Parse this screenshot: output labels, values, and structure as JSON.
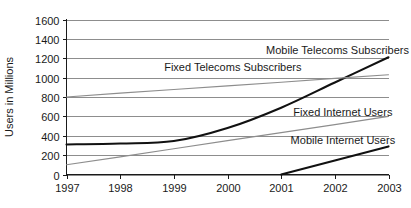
{
  "chart_data": {
    "type": "line",
    "title": "",
    "xlabel": "",
    "ylabel": "Users in Millions",
    "x": [
      1997,
      1998,
      1999,
      2000,
      2001,
      2002,
      2003
    ],
    "xticklabels": [
      "1997",
      "1998",
      "1999",
      "2000",
      "2001",
      "2002",
      "2003"
    ],
    "yticks": [
      0,
      200,
      400,
      600,
      800,
      1000,
      1200,
      1400,
      1600
    ],
    "yticklabels": [
      "0",
      "200",
      "400",
      "600",
      "800",
      "1000",
      "1200",
      "1400",
      "1600"
    ],
    "xlim": [
      1997,
      2003
    ],
    "ylim": [
      0,
      1600
    ],
    "grid": "horizontal",
    "legend_position": "inline-labels",
    "series": [
      {
        "name": "Mobile Telecoms Subscribers",
        "style": "bold",
        "color": "#111111",
        "x": [
          1997,
          1998,
          1999,
          2000,
          2001,
          2002,
          2003
        ],
        "values": [
          310,
          320,
          345,
          480,
          690,
          950,
          1210
        ],
        "label_x": 2002.05,
        "label_y": 1290,
        "label_anchor": "middle"
      },
      {
        "name": "Fixed Telecoms Subscribers",
        "style": "thin",
        "color": "#8d8d8d",
        "x": [
          1997,
          1998,
          1999,
          2000,
          2001,
          2002,
          2003
        ],
        "values": [
          800,
          840,
          878,
          915,
          952,
          992,
          1030
        ],
        "label_x": 2000.1,
        "label_y": 1105,
        "label_anchor": "middle"
      },
      {
        "name": "Fixed Internet Users",
        "style": "thin",
        "color": "#8d8d8d",
        "x": [
          1997,
          1998,
          1999,
          2000,
          2001,
          2002,
          2003
        ],
        "values": [
          100,
          182,
          265,
          350,
          432,
          515,
          600
        ],
        "label_x": 2002.15,
        "label_y": 650,
        "label_anchor": "middle"
      },
      {
        "name": "Mobile Internet Users",
        "style": "bold",
        "color": "#111111",
        "x": [
          2001,
          2002,
          2003
        ],
        "values": [
          0,
          145,
          290
        ],
        "label_x": 2002.15,
        "label_y": 355,
        "label_anchor": "middle"
      }
    ]
  },
  "axes": {
    "y_axis_title": "Users in Millions"
  }
}
